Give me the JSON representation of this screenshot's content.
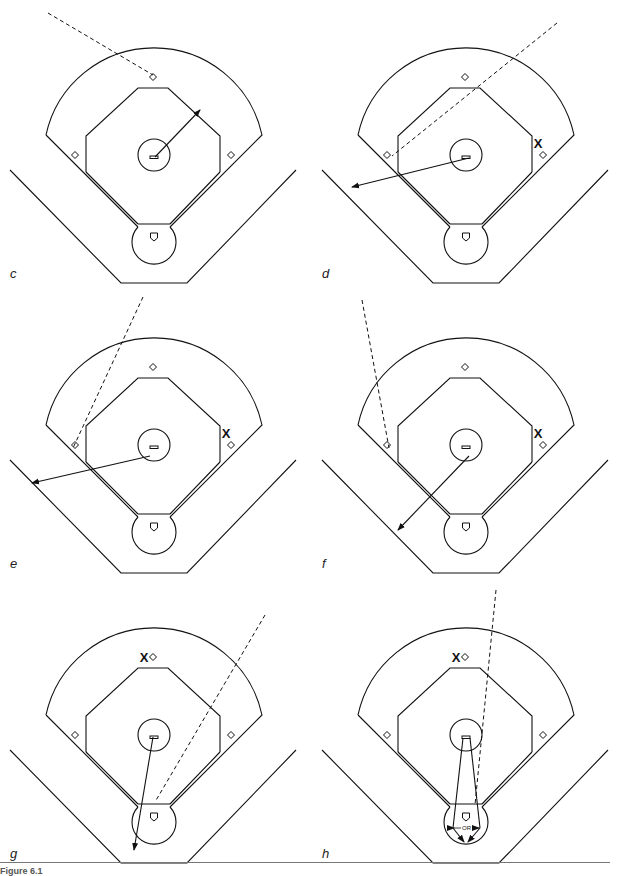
{
  "figure": {
    "caption": "Figure 6.1",
    "panels": [
      {
        "id": "c",
        "label": "c",
        "x": 0,
        "y": 0,
        "marker": null,
        "dashed": [
          [
            48,
            13
          ],
          [
            153,
            75
          ]
        ],
        "arrow": [
          [
            155,
            157
          ],
          [
            200,
            110
          ]
        ]
      },
      {
        "id": "d",
        "label": "d",
        "x": 312,
        "y": 0,
        "marker": "first",
        "dashed": [
          [
            245,
            23
          ],
          [
            80,
            156
          ]
        ],
        "arrow": [
          [
            157,
            158
          ],
          [
            40,
            187
          ]
        ]
      },
      {
        "id": "e",
        "label": "e",
        "x": 0,
        "y": 290,
        "marker": "first",
        "dashed": [
          [
            143,
            7
          ],
          [
            73,
            158
          ]
        ],
        "arrow": [
          [
            150,
            166
          ],
          [
            32,
            193
          ]
        ]
      },
      {
        "id": "f",
        "label": "f",
        "x": 312,
        "y": 290,
        "marker": "first",
        "dashed": [
          [
            50,
            10
          ],
          [
            77,
            158
          ]
        ],
        "arrow": [
          [
            157,
            166
          ],
          [
            86,
            240
          ]
        ]
      },
      {
        "id": "g",
        "label": "g",
        "x": 0,
        "y": 580,
        "marker": "second",
        "dashed": [
          [
            265,
            35
          ],
          [
            155,
            222
          ]
        ],
        "arrow": [
          [
            153,
            157
          ],
          [
            134,
            270
          ]
        ]
      },
      {
        "id": "h",
        "label": "h",
        "x": 312,
        "y": 580,
        "marker": "second",
        "dashed": [
          [
            184,
            10
          ],
          [
            163,
            225
          ]
        ],
        "arrow": null,
        "fan": true,
        "or_label": "OR"
      }
    ]
  },
  "symbols": {
    "x_marker": "X",
    "base_icon": "diamond",
    "home_icon": "home-plate",
    "rubber_icon": "pitchers-rubber"
  },
  "colors": {
    "line": "#111111",
    "background": "#ffffff",
    "rule": "#777777"
  }
}
